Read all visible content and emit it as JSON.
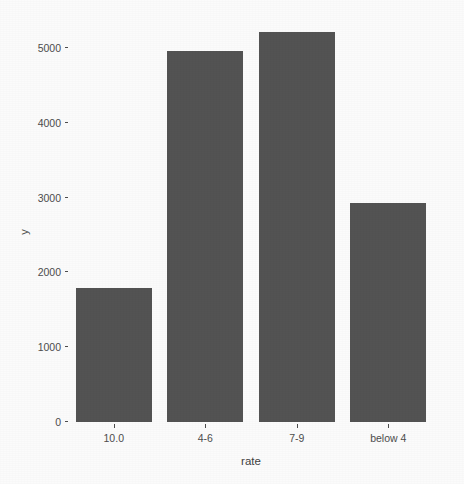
{
  "chart_data": {
    "type": "bar",
    "title": "",
    "subtitle": "",
    "xlabel": "rate",
    "ylabel": "y",
    "categories": [
      "10.0",
      "4-6",
      "7-9",
      "below 4"
    ],
    "values": [
      1790,
      4960,
      5215,
      2930
    ],
    "series": [
      {
        "name": "count",
        "values": [
          1790,
          4960,
          5215,
          2930
        ]
      }
    ],
    "ylim": [
      0,
      5400
    ],
    "yticks": [
      0,
      1000,
      2000,
      3000,
      4000,
      5000
    ],
    "ytick_labels": [
      "0",
      "1000",
      "2000",
      "3000",
      "4000",
      "5000"
    ],
    "xtick_labels": [
      "10.0",
      "4-6",
      "7-9",
      "below 4"
    ],
    "grid": false,
    "legend": false,
    "legend_position": "none",
    "bar_color": "#535353",
    "panel_background": "#fbfbfb",
    "axis_text_color": "#4d4d4d"
  }
}
